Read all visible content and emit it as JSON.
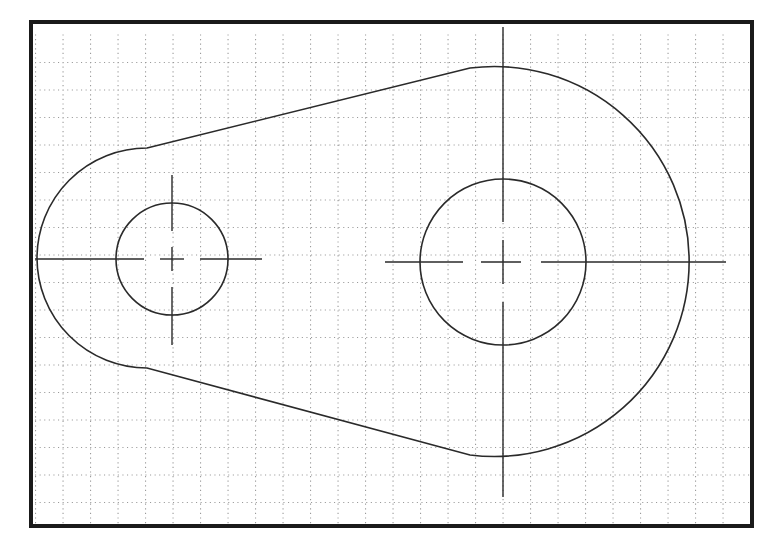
{
  "drawing": {
    "title": "",
    "colors": {
      "background": "#ffffff",
      "frame": "#1a1a1a",
      "stroke": "#2a2a2a",
      "grid": "#9a9a9a"
    },
    "frame": {
      "x": 31,
      "y": 22,
      "width": 721,
      "height": 504,
      "stroke_width": 4
    },
    "grid": {
      "x0": 35,
      "y0": 35,
      "x1": 750,
      "y1": 523,
      "spacing": 27.5,
      "dot": 1.1,
      "dot_step": 4.6
    },
    "left_hole": {
      "cx": 172,
      "cy": 259,
      "r": 56
    },
    "right_hole": {
      "cx": 503,
      "cy": 262,
      "r": 83
    },
    "outline": {
      "left_arc_r": 110,
      "right_arc_r": 195,
      "upper_tangent": {
        "x1": 147,
        "y1": 148,
        "x2": 470,
        "y2": 68
      },
      "lower_tangent": {
        "x1": 147,
        "y1": 368,
        "x2": 470,
        "y2": 455
      }
    },
    "centerlines": {
      "left_horizontal": {
        "x1": 35,
        "x2": 262,
        "y": 259
      },
      "left_vertical": {
        "x": 172,
        "y1": 175,
        "y2": 345
      },
      "right_horizontal": {
        "x1": 385,
        "x2": 726,
        "y": 262
      },
      "right_vertical": {
        "x": 503,
        "y1": 27,
        "y2": 497
      }
    }
  }
}
